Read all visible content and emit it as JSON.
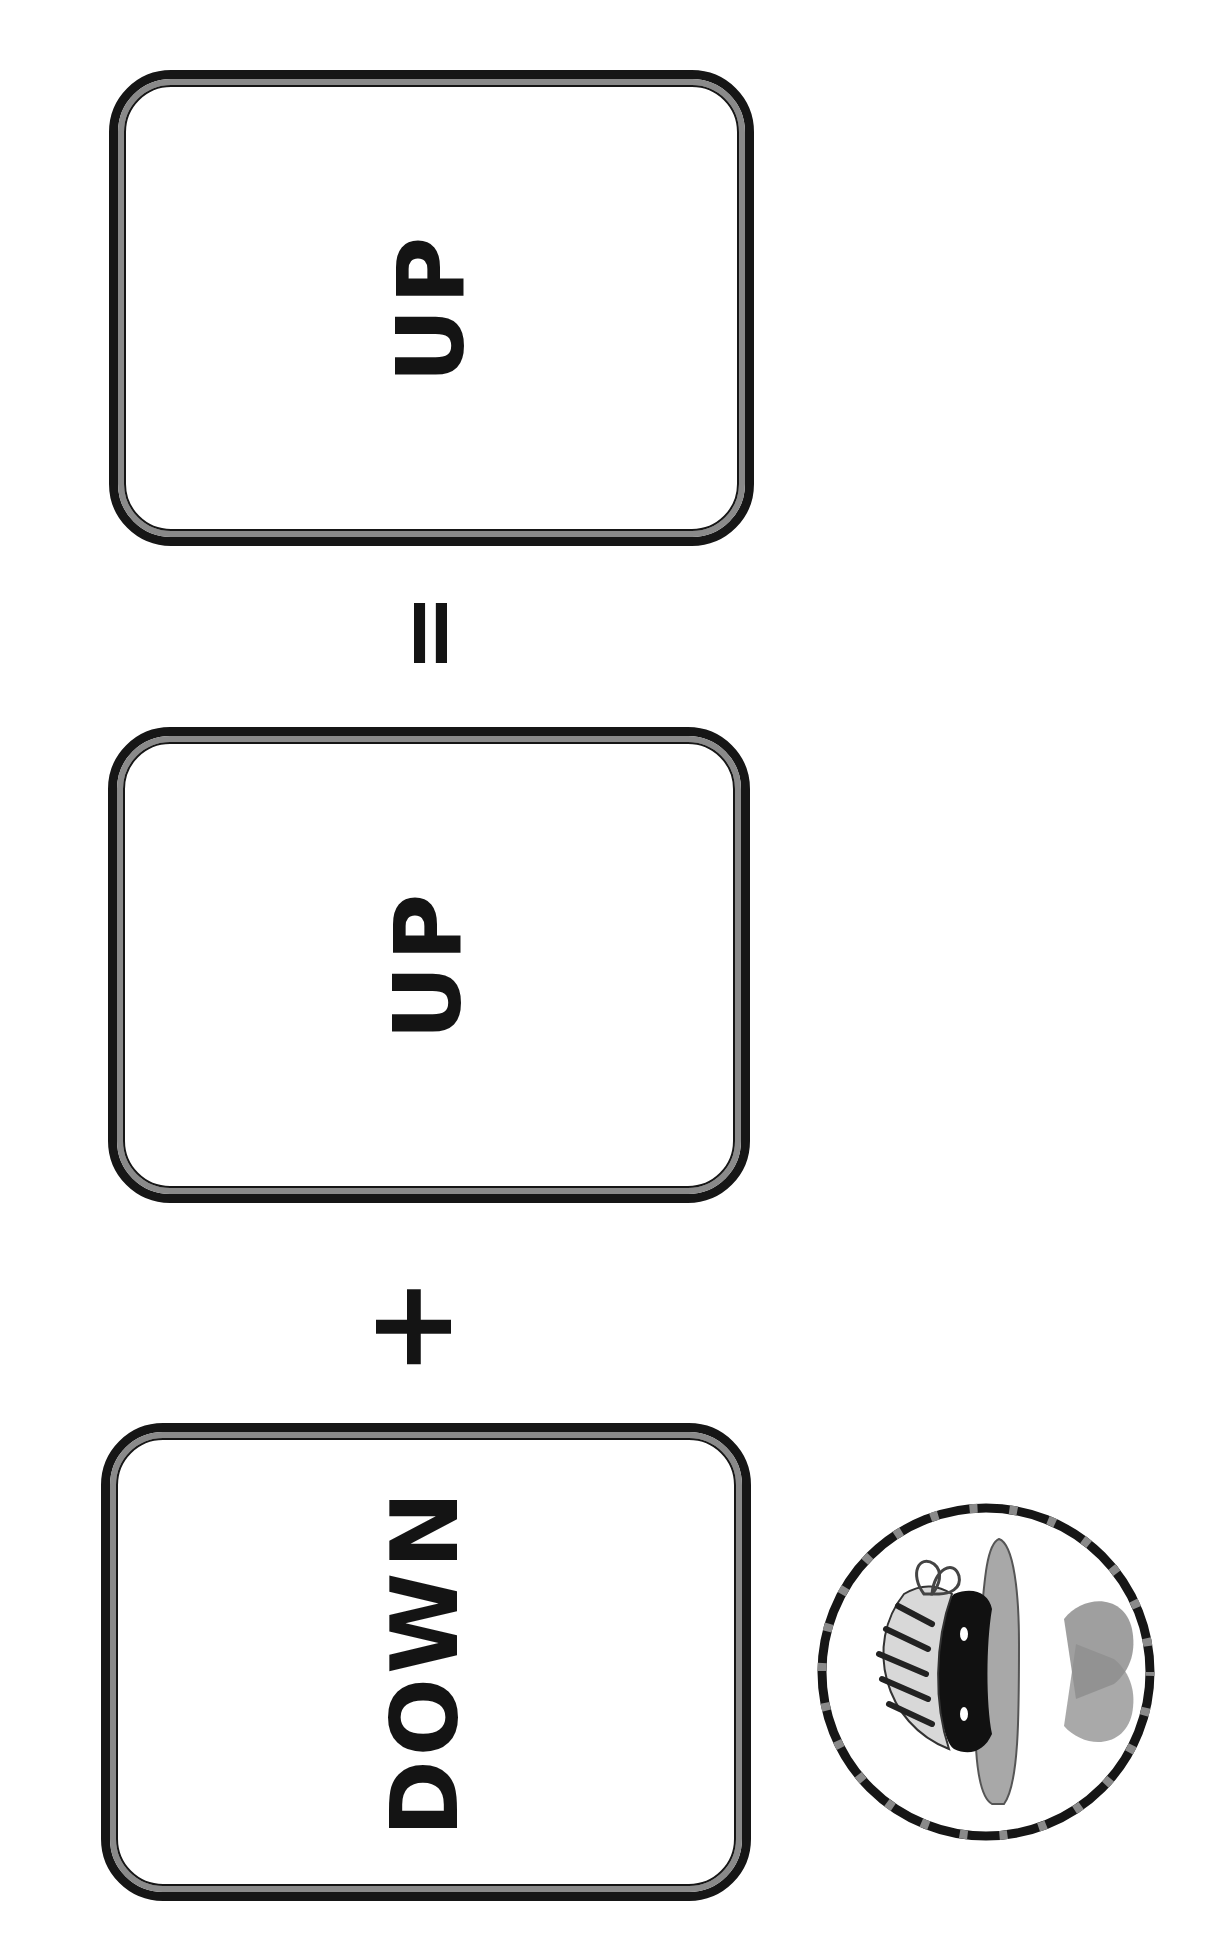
{
  "worksheet": {
    "orientation": "rotated -90deg",
    "equation": {
      "cards": [
        {
          "id": "card-result",
          "word": "UP"
        },
        {
          "id": "card-second",
          "word": "UP"
        },
        {
          "id": "card-first",
          "word": "DOWN"
        }
      ],
      "operators": {
        "equals": "=",
        "plus": "+"
      },
      "reading_order": "DOWN + UP = UP"
    },
    "badge": {
      "icon": "character-illustration-icon",
      "description": "circular badge with dashed ring containing a grayscale illustration of a character wearing a striped bandana and mask"
    },
    "colors": {
      "ink": "#141414",
      "border_gray": "#8a8a8a",
      "background": "#ffffff"
    }
  }
}
